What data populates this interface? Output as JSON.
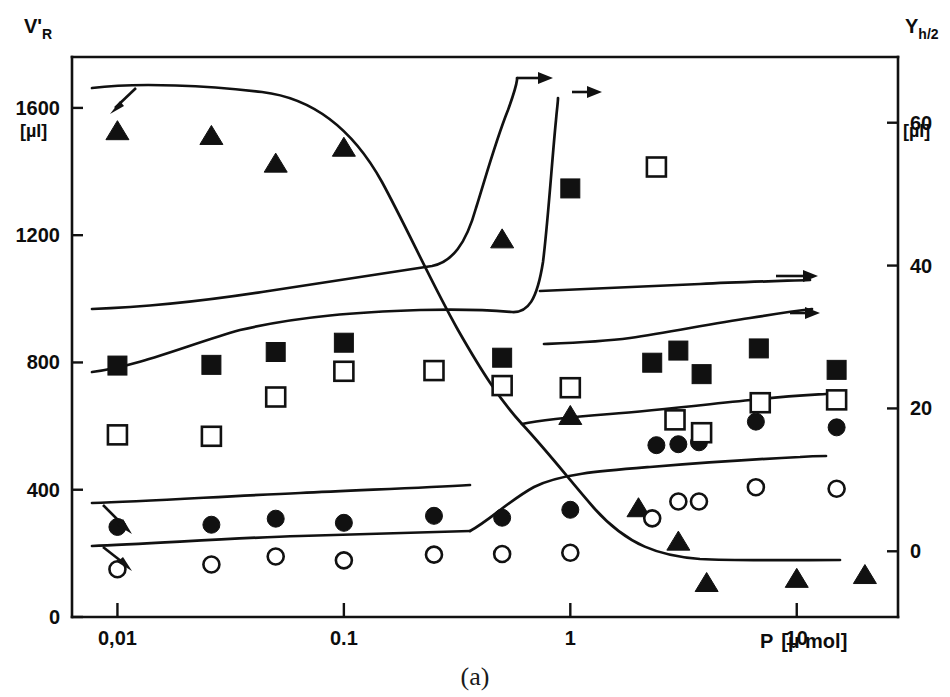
{
  "figure": {
    "caption": "(a)",
    "background_color": "#ffffff",
    "ink_color": "#111111"
  },
  "chart_data": {
    "type": "scatter",
    "title": "",
    "subtitle": "",
    "xlabel": "P [µ mol]",
    "xlabel_parts": {
      "symbol": "P",
      "unit": "[µ mol]"
    },
    "xscale": "log",
    "xlim": [
      0.0063,
      28
    ],
    "x_tick_labels": [
      "0,01",
      "0.1",
      "1",
      "10"
    ],
    "x_tick_values": [
      0.01,
      0.1,
      1,
      10
    ],
    "grid": false,
    "legend": "none",
    "left_axis": {
      "label": "V'R",
      "label_symbol": "V'",
      "label_subscript": "R",
      "unit": "[µl]",
      "tick_labels": [
        "1600",
        "1200",
        "800",
        "400",
        "0"
      ],
      "tick_values": [
        1600,
        1200,
        800,
        400,
        0
      ],
      "ylim": [
        0,
        1760
      ]
    },
    "right_axis": {
      "label": "Yh/2",
      "label_symbol": "Y",
      "label_subscript": "h/2",
      "unit": "[µl]",
      "tick_labels": [
        "60",
        "40",
        "20",
        "0"
      ],
      "tick_values": [
        60,
        40,
        20,
        0
      ],
      "ylim": [
        -9.2,
        69.2
      ]
    },
    "series": [
      {
        "name": "filled-triangle-descending",
        "marker": "filled-triangle",
        "axis": "left",
        "arrow_annotation": "down-left-arrow near first points",
        "points": [
          {
            "x": 0.01,
            "y": 1530
          },
          {
            "x": 0.026,
            "y": 1515
          },
          {
            "x": 0.05,
            "y": 1428
          },
          {
            "x": 0.1,
            "y": 1478
          },
          {
            "x": 0.5,
            "y": 1190
          },
          {
            "x": 1.0,
            "y": 635
          },
          {
            "x": 2.0,
            "y": 345
          },
          {
            "x": 3.0,
            "y": 240
          },
          {
            "x": 4.0,
            "y": 110
          },
          {
            "x": 10.0,
            "y": 123
          },
          {
            "x": 20.0,
            "y": 135
          }
        ]
      },
      {
        "name": "filled-square-rising",
        "marker": "filled-square",
        "axis": "right",
        "arrow_annotation": "right-arrow at top",
        "points": [
          {
            "x": 0.01,
            "y": 26.0
          },
          {
            "x": 0.026,
            "y": 26.1
          },
          {
            "x": 0.05,
            "y": 27.9
          },
          {
            "x": 0.1,
            "y": 29.2
          },
          {
            "x": 0.5,
            "y": 27.1
          },
          {
            "x": 1.0,
            "y": 50.8
          }
        ]
      },
      {
        "name": "open-square-rising",
        "marker": "open-square",
        "axis": "right",
        "arrow_annotation": "right-arrow at top",
        "points": [
          {
            "x": 0.01,
            "y": 16.3
          },
          {
            "x": 0.026,
            "y": 16.1
          },
          {
            "x": 0.05,
            "y": 21.6
          },
          {
            "x": 0.1,
            "y": 25.2
          },
          {
            "x": 0.25,
            "y": 25.3
          },
          {
            "x": 0.5,
            "y": 23.2
          },
          {
            "x": 1.0,
            "y": 22.9
          },
          {
            "x": 2.4,
            "y": 53.8
          }
        ]
      },
      {
        "name": "filled-circle-left",
        "marker": "filled-circle",
        "axis": "left",
        "arrow_annotation": "down-right-arrow",
        "points": [
          {
            "x": 0.01,
            "y": 283
          },
          {
            "x": 0.026,
            "y": 290
          },
          {
            "x": 0.05,
            "y": 309
          },
          {
            "x": 0.1,
            "y": 296
          },
          {
            "x": 0.25,
            "y": 318
          },
          {
            "x": 0.5,
            "y": 312
          },
          {
            "x": 1.0,
            "y": 337
          }
        ]
      },
      {
        "name": "open-circle-left",
        "marker": "open-circle",
        "axis": "left",
        "arrow_annotation": "down-right-arrow",
        "points": [
          {
            "x": 0.01,
            "y": 150
          },
          {
            "x": 0.026,
            "y": 165
          },
          {
            "x": 0.05,
            "y": 190
          },
          {
            "x": 0.1,
            "y": 178
          },
          {
            "x": 0.25,
            "y": 196
          },
          {
            "x": 0.5,
            "y": 198
          },
          {
            "x": 1.0,
            "y": 202
          }
        ]
      },
      {
        "name": "filled-circle-right",
        "marker": "filled-circle",
        "axis": "left",
        "points": [
          {
            "x": 2.4,
            "y": 540
          },
          {
            "x": 3.0,
            "y": 543
          },
          {
            "x": 3.7,
            "y": 549
          },
          {
            "x": 6.6,
            "y": 614
          },
          {
            "x": 15.0,
            "y": 596
          }
        ]
      },
      {
        "name": "open-circle-right",
        "marker": "open-circle",
        "axis": "left",
        "points": [
          {
            "x": 2.3,
            "y": 310
          },
          {
            "x": 3.0,
            "y": 363
          },
          {
            "x": 3.7,
            "y": 363
          },
          {
            "x": 6.6,
            "y": 408
          },
          {
            "x": 15.0,
            "y": 403
          }
        ]
      },
      {
        "name": "filled-square-right-plateau",
        "marker": "filled-square",
        "axis": "right",
        "arrow_annotation": "right-arrow",
        "points": [
          {
            "x": 2.3,
            "y": 26.4
          },
          {
            "x": 3.0,
            "y": 28.1
          },
          {
            "x": 3.8,
            "y": 24.8
          },
          {
            "x": 6.8,
            "y": 28.4
          },
          {
            "x": 15.0,
            "y": 25.4
          }
        ]
      },
      {
        "name": "open-square-right-plateau",
        "marker": "open-square",
        "axis": "right",
        "arrow_annotation": "right-arrow",
        "points": [
          {
            "x": 2.9,
            "y": 18.4
          },
          {
            "x": 3.8,
            "y": 16.6
          },
          {
            "x": 6.9,
            "y": 20.8
          },
          {
            "x": 15.0,
            "y": 21.2
          }
        ]
      }
    ]
  }
}
